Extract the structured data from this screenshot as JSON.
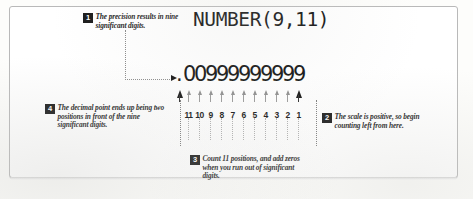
{
  "figure": {
    "code_title": "NUMBER(9,11)",
    "number_value": ".00999999999",
    "number_chars": [
      ".",
      "0",
      "0",
      "9",
      "9",
      "9",
      "9",
      "9",
      "9",
      "9",
      "9",
      "9"
    ],
    "position_labels": [
      "11",
      "10",
      "9",
      "8",
      "7",
      "6",
      "5",
      "4",
      "3",
      "2",
      "1"
    ],
    "marker_types": [
      "big",
      "small",
      "small",
      "small",
      "small",
      "small",
      "small",
      "small",
      "small",
      "small",
      "small",
      "big"
    ]
  },
  "callouts": [
    {
      "number": "1",
      "text": "The precision results in nine significant digits."
    },
    {
      "number": "2",
      "text": "The scale is positive, so begin counting left from here."
    },
    {
      "number": "3",
      "text": "Count 11 positions, and add zeros when you run out of significant digits."
    },
    {
      "number": "4",
      "text": "The decimal point ends up being two positions in front of the nine significant digits."
    }
  ],
  "colors": {
    "ink": "#111111",
    "badge_background": "#1a1a1a",
    "badge_text": "#ffffff",
    "guide": "#8a8a8a",
    "marker_muted": "#8e8e8e",
    "page": "#ffffff",
    "frame_border": "#b9b9b9"
  }
}
